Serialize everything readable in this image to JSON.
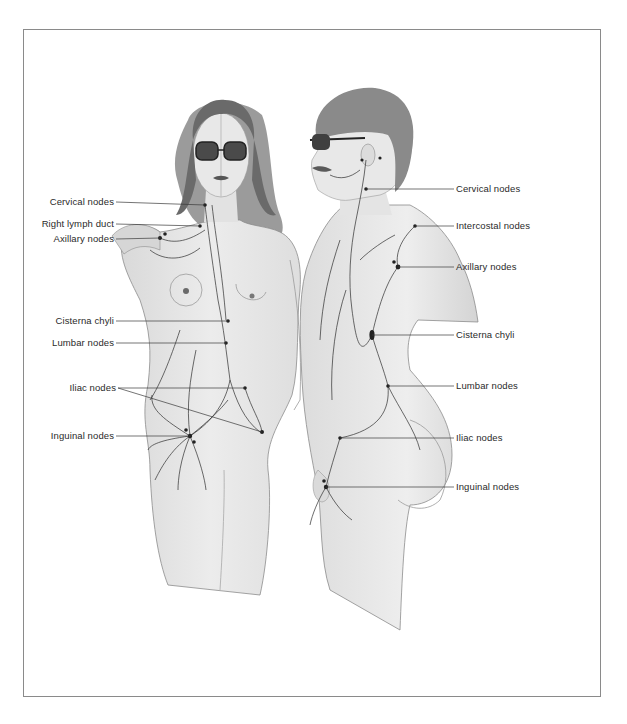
{
  "figure": {
    "left_labels": [
      {
        "text": "Cervical nodes",
        "x": 116,
        "y": 202,
        "line_to": [
          205,
          205
        ]
      },
      {
        "text": "Right lymph duct",
        "x": 116,
        "y": 224,
        "line_to": [
          200,
          226
        ]
      },
      {
        "text": "Axillary nodes",
        "x": 116,
        "y": 239,
        "line_to": [
          160,
          238
        ]
      },
      {
        "text": "Cisterna chyli",
        "x": 116,
        "y": 321,
        "line_to": [
          228,
          321
        ]
      },
      {
        "text": "Lumbar nodes",
        "x": 116,
        "y": 343,
        "line_to": [
          226,
          343
        ]
      },
      {
        "text": "Iliac nodes",
        "x": 116,
        "y": 388,
        "line_to": [
          245,
          388
        ]
      },
      {
        "text": "Inguinal nodes",
        "x": 116,
        "y": 436,
        "line_to": [
          190,
          436
        ]
      }
    ],
    "right_labels": [
      {
        "text": "Cervical nodes",
        "x": 456,
        "y": 189,
        "line_from": [
          366,
          189
        ]
      },
      {
        "text": "Intercostal nodes",
        "x": 456,
        "y": 226,
        "line_from": [
          415,
          226
        ]
      },
      {
        "text": "Axillary nodes",
        "x": 456,
        "y": 267,
        "line_from": [
          398,
          267
        ]
      },
      {
        "text": "Cisterna chyli",
        "x": 456,
        "y": 335,
        "line_from": [
          372,
          335
        ]
      },
      {
        "text": "Lumbar nodes",
        "x": 456,
        "y": 386,
        "line_from": [
          388,
          386
        ]
      },
      {
        "text": "Iliac nodes",
        "x": 456,
        "y": 438,
        "line_from": [
          340,
          438
        ]
      },
      {
        "text": "Inguinal nodes",
        "x": 456,
        "y": 487,
        "line_from": [
          326,
          487
        ]
      }
    ]
  },
  "colors": {
    "frame": "#8a8a8a",
    "label_text": "#2a2a2a",
    "leader_line": "#3a3a3a",
    "skin_shade": "#e6e6e6",
    "hair": "#6a6a6a",
    "lymph": "#2e2e2e"
  }
}
